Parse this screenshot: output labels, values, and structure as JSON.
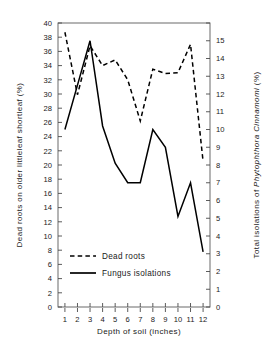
{
  "chart_data": {
    "type": "line",
    "title": "",
    "xlabel": "Depth of soil (inches)",
    "ylabel": "Dead roots on older littleleaf shortleaf  (%)",
    "y2label_prefix": "Total isolations of ",
    "y2label_italic": "Phytophthora Cinnamomi",
    "y2label_suffix": "  (%)",
    "x": [
      1,
      2,
      3,
      4,
      5,
      6,
      7,
      8,
      9,
      10,
      11,
      12
    ],
    "xticklabels": [
      "1",
      "2",
      "3",
      "4",
      "5",
      "6",
      "7",
      "8",
      "9",
      "10",
      "11",
      "12"
    ],
    "xlim": [
      0.45,
      12.55
    ],
    "ylim": [
      0,
      40
    ],
    "yticks": [
      0,
      2,
      4,
      6,
      8,
      10,
      12,
      14,
      16,
      18,
      20,
      22,
      24,
      26,
      28,
      30,
      32,
      34,
      36,
      38,
      40
    ],
    "yticklabels": [
      "0",
      "2",
      "4",
      "6",
      "8",
      "10",
      "12",
      "14",
      "16",
      "18",
      "20",
      "22",
      "24",
      "26",
      "28",
      "30",
      "32",
      "34",
      "36",
      "38",
      "40"
    ],
    "y2lim": [
      0,
      16
    ],
    "y2ticks": [
      0,
      1,
      2,
      3,
      4,
      5,
      6,
      7,
      8,
      9,
      10,
      11,
      12,
      13,
      14,
      15,
      16
    ],
    "y2ticklabels": [
      "0",
      "1",
      "2",
      "3",
      "4",
      "5",
      "6",
      "7",
      "8",
      "9",
      "10",
      "11",
      "12",
      "13",
      "14",
      "15",
      ""
    ],
    "grid": false,
    "legend_position": "lower-left-inside",
    "series": [
      {
        "name": "Dead roots",
        "axis": "left",
        "style": "dashed",
        "color": "#000000",
        "values": [
          38.7,
          29.9,
          36.8,
          34.0,
          34.8,
          32.0,
          26.2,
          33.5,
          32.9,
          33.0,
          37.0,
          20.5
        ]
      },
      {
        "name": "Fungus isolations",
        "axis": "right",
        "style": "solid",
        "color": "#000000",
        "values": [
          10.0,
          12.5,
          15.0,
          10.2,
          8.1,
          7.0,
          7.0,
          10.0,
          9.0,
          5.1,
          7.0,
          3.1
        ]
      }
    ]
  },
  "legend": {
    "items": [
      {
        "label": "Dead roots",
        "style": "dashed"
      },
      {
        "label": "Fungus isolations",
        "style": "solid"
      }
    ]
  }
}
